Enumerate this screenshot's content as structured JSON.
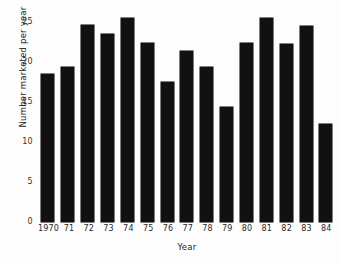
{
  "chart_data": {
    "type": "bar",
    "title": "",
    "xlabel": "Year",
    "ylabel": "Number marketed per year",
    "categories": [
      "1970",
      "71",
      "72",
      "73",
      "74",
      "75",
      "76",
      "77",
      "78",
      "79",
      "80",
      "81",
      "82",
      "83",
      "84"
    ],
    "values": [
      18.5,
      19.4,
      24.6,
      23.5,
      25.5,
      22.4,
      17.5,
      21.4,
      19.4,
      14.4,
      22.4,
      25.5,
      22.3,
      24.5,
      12.2
    ],
    "ylim": [
      0,
      26
    ],
    "y_ticks": [
      0,
      5,
      10,
      15,
      20,
      25
    ],
    "y_tick_labels": [
      "0",
      "5",
      "10",
      "15",
      "20",
      "25"
    ],
    "grid": false,
    "legend": false,
    "bar_color": "#111111",
    "background_color": "#fdfdfd"
  }
}
